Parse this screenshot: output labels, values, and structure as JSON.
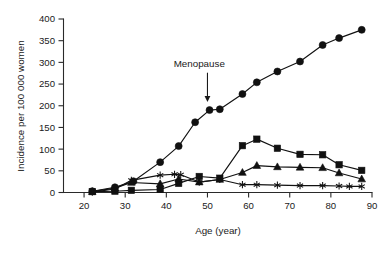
{
  "chart_data": {
    "type": "line",
    "title": "",
    "xlabel": "Age (year)",
    "ylabel": "Incidence per 100 000 women",
    "xlim": [
      15,
      90
    ],
    "ylim": [
      0,
      400
    ],
    "xticks": [
      20,
      30,
      40,
      50,
      60,
      70,
      80,
      90
    ],
    "yticks": [
      0,
      50,
      100,
      150,
      200,
      250,
      300,
      350,
      400
    ],
    "xtick_labels": [
      "20",
      "30",
      "40",
      "50",
      "60",
      "70",
      "80",
      "90"
    ],
    "ytick_labels": [
      "0",
      "50",
      "100",
      "150",
      "200",
      "250",
      "300",
      "350",
      "400"
    ],
    "grid": false,
    "legend": null,
    "annotations": [
      {
        "label": "Menopause",
        "x": 50,
        "y": 190,
        "text_x": 48,
        "text_y": 290,
        "arrow": "down"
      }
    ],
    "series": [
      {
        "name": "circle-series",
        "marker": "circle",
        "x": [
          22,
          27.5,
          32,
          38.5,
          43,
          47,
          50.5,
          53,
          58.5,
          62,
          67,
          72.5,
          78,
          82,
          87.5
        ],
        "values": [
          3,
          12,
          26,
          70,
          107,
          162,
          190,
          192,
          227,
          254,
          279,
          302,
          340,
          356,
          375
        ]
      },
      {
        "name": "square-series",
        "marker": "square",
        "x": [
          22,
          27.5,
          31.5,
          38.5,
          43,
          48,
          53,
          58.5,
          62,
          67,
          72.5,
          78,
          82,
          87.5
        ],
        "values": [
          2,
          3,
          5,
          7,
          21,
          37,
          33,
          108,
          123,
          102,
          88,
          87,
          64,
          51
        ]
      },
      {
        "name": "triangle-series",
        "marker": "triangle",
        "x": [
          22,
          27.5,
          31.5,
          38.5,
          43,
          48,
          53,
          58.5,
          62,
          67,
          72.5,
          78,
          82,
          87.5
        ],
        "values": [
          2,
          10,
          23,
          20,
          31,
          24,
          30,
          46,
          62,
          59,
          58,
          57,
          45,
          31
        ]
      },
      {
        "name": "star-series",
        "marker": "star",
        "x": [
          22,
          27.5,
          31.5,
          38.5,
          42,
          43.5,
          48,
          53,
          58.5,
          62,
          67,
          72.5,
          78,
          82,
          84.5,
          87.5
        ],
        "values": [
          1,
          8,
          28,
          40,
          42,
          41,
          24,
          30,
          18,
          18,
          17,
          16,
          16,
          15,
          14,
          14
        ]
      }
    ]
  }
}
